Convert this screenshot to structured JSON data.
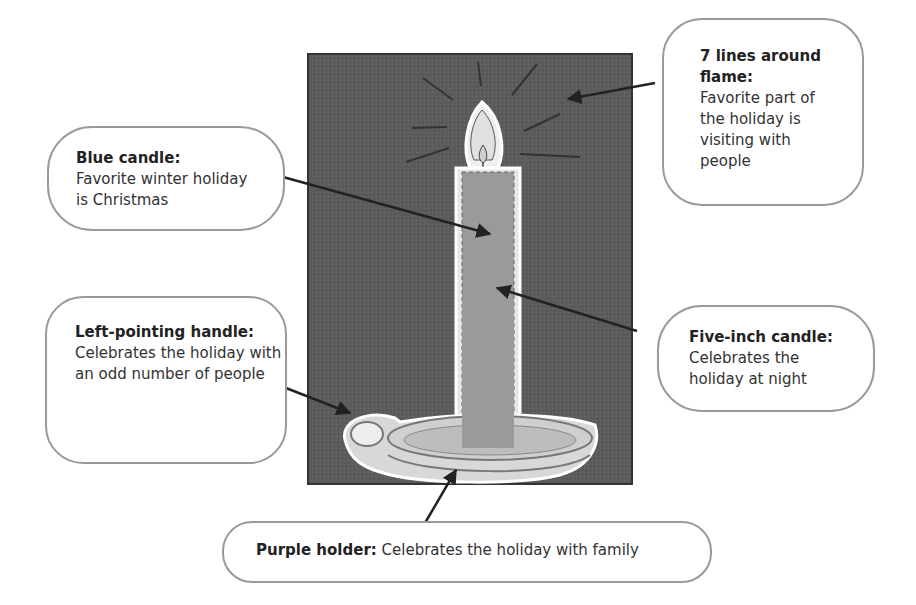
{
  "diagram": {
    "type": "annotated illustration",
    "background_color": "#5a5a5a",
    "callouts": [
      {
        "id": "blue-candle",
        "title": "Blue candle:",
        "text": "Favorite winter holiday is Christmas"
      },
      {
        "id": "seven-lines",
        "title": "7 lines around flame:",
        "text": "Favorite part of the holiday is visiting with people"
      },
      {
        "id": "left-handle",
        "title": "Left-pointing handle:",
        "text": "Celebrates the holiday with an odd number of people"
      },
      {
        "id": "five-inch",
        "title": "Five-inch candle:",
        "text": "Celebrates the holiday at night"
      },
      {
        "id": "purple-holder",
        "title": "Purple holder:",
        "text": "Celebrates the holiday with family"
      }
    ]
  }
}
